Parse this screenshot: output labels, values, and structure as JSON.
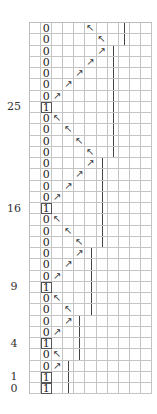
{
  "diagram": {
    "type": "grid-trace",
    "columns": 11,
    "digit_column": 1,
    "arrow_glyphs": {
      "up-left": "↖",
      "up-right": "↗"
    },
    "rows": [
      {
        "digit": "0",
        "arrow": "up-left",
        "arrow_col": 5,
        "bar_col": 8,
        "label": ""
      },
      {
        "digit": "0",
        "arrow": "up-left",
        "arrow_col": 6,
        "bar_col": 8,
        "label": ""
      },
      {
        "digit": "0",
        "arrow": "up-right",
        "arrow_col": 6,
        "bar_col": 7,
        "label": ""
      },
      {
        "digit": "0",
        "arrow": "up-right",
        "arrow_col": 5,
        "bar_col": 7,
        "label": ""
      },
      {
        "digit": "0",
        "arrow": "up-right",
        "arrow_col": 4,
        "bar_col": 7,
        "label": ""
      },
      {
        "digit": "0",
        "arrow": "up-right",
        "arrow_col": 3,
        "bar_col": 7,
        "label": ""
      },
      {
        "digit": "0",
        "arrow": "up-right",
        "arrow_col": 2,
        "bar_col": 7,
        "label": ""
      },
      {
        "digit": "1",
        "arrow": "",
        "arrow_col": -1,
        "bar_col": 7,
        "label": "25"
      },
      {
        "digit": "0",
        "arrow": "up-left",
        "arrow_col": 2,
        "bar_col": 7,
        "label": ""
      },
      {
        "digit": "0",
        "arrow": "up-left",
        "arrow_col": 3,
        "bar_col": 7,
        "label": ""
      },
      {
        "digit": "0",
        "arrow": "up-left",
        "arrow_col": 4,
        "bar_col": 7,
        "label": ""
      },
      {
        "digit": "0",
        "arrow": "up-left",
        "arrow_col": 5,
        "bar_col": 7,
        "label": ""
      },
      {
        "digit": "0",
        "arrow": "up-right",
        "arrow_col": 5,
        "bar_col": 6,
        "label": ""
      },
      {
        "digit": "0",
        "arrow": "up-right",
        "arrow_col": 4,
        "bar_col": 6,
        "label": ""
      },
      {
        "digit": "0",
        "arrow": "up-right",
        "arrow_col": 3,
        "bar_col": 6,
        "label": ""
      },
      {
        "digit": "0",
        "arrow": "up-right",
        "arrow_col": 2,
        "bar_col": 6,
        "label": ""
      },
      {
        "digit": "1",
        "arrow": "",
        "arrow_col": -1,
        "bar_col": 6,
        "label": "16"
      },
      {
        "digit": "0",
        "arrow": "up-left",
        "arrow_col": 2,
        "bar_col": 6,
        "label": ""
      },
      {
        "digit": "0",
        "arrow": "up-left",
        "arrow_col": 3,
        "bar_col": 6,
        "label": ""
      },
      {
        "digit": "0",
        "arrow": "up-left",
        "arrow_col": 4,
        "bar_col": 6,
        "label": ""
      },
      {
        "digit": "0",
        "arrow": "up-right",
        "arrow_col": 4,
        "bar_col": 5,
        "label": ""
      },
      {
        "digit": "0",
        "arrow": "up-right",
        "arrow_col": 3,
        "bar_col": 5,
        "label": ""
      },
      {
        "digit": "0",
        "arrow": "up-right",
        "arrow_col": 2,
        "bar_col": 5,
        "label": ""
      },
      {
        "digit": "1",
        "arrow": "",
        "arrow_col": -1,
        "bar_col": 5,
        "label": "9"
      },
      {
        "digit": "0",
        "arrow": "up-left",
        "arrow_col": 2,
        "bar_col": 5,
        "label": ""
      },
      {
        "digit": "0",
        "arrow": "up-left",
        "arrow_col": 3,
        "bar_col": 5,
        "label": ""
      },
      {
        "digit": "0",
        "arrow": "up-right",
        "arrow_col": 3,
        "bar_col": 4,
        "label": ""
      },
      {
        "digit": "0",
        "arrow": "up-right",
        "arrow_col": 2,
        "bar_col": 4,
        "label": ""
      },
      {
        "digit": "1",
        "arrow": "",
        "arrow_col": -1,
        "bar_col": 4,
        "label": "4"
      },
      {
        "digit": "0",
        "arrow": "up-left",
        "arrow_col": 2,
        "bar_col": 4,
        "label": ""
      },
      {
        "digit": "0",
        "arrow": "up-right",
        "arrow_col": 2,
        "bar_col": 3,
        "label": ""
      },
      {
        "digit": "1",
        "arrow": "",
        "arrow_col": -1,
        "bar_col": 3,
        "label": "1"
      },
      {
        "digit": "1",
        "arrow": "",
        "arrow_col": -1,
        "bar_col": 3,
        "label": "0"
      }
    ]
  }
}
